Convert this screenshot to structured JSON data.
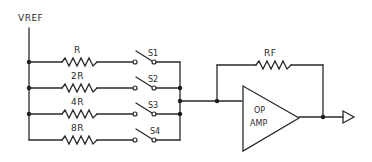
{
  "diagram": {
    "reference_label": "VREF",
    "branches": [
      {
        "resistor": "R",
        "switch": "S1"
      },
      {
        "resistor": "2R",
        "switch": "S2"
      },
      {
        "resistor": "4R",
        "switch": "S3"
      },
      {
        "resistor": "8R",
        "switch": "S4"
      }
    ],
    "feedback_resistor": "RF",
    "amplifier": {
      "line1": "OP",
      "line2": "AMP"
    },
    "output_symbol": "output-arrow",
    "colors": {
      "line": "#2a2a2a",
      "background": "#ffffff"
    }
  }
}
